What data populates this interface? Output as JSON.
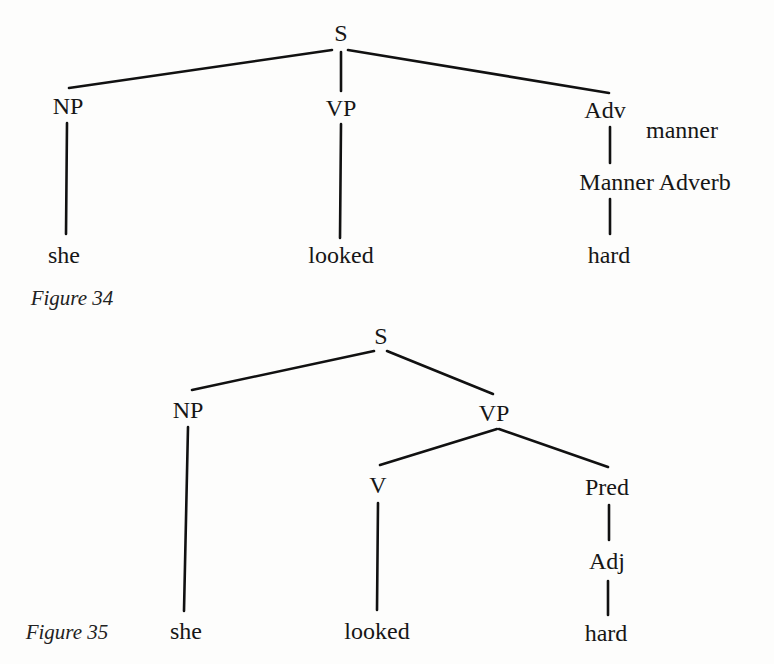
{
  "figures": [
    {
      "caption": "Figure 34",
      "nodes": {
        "s": "S",
        "np": "NP",
        "vp": "VP",
        "adv": "Adv",
        "adv_sub": "manner",
        "manner_adverb": "Manner Adverb",
        "she": "she",
        "looked": "looked",
        "hard": "hard"
      }
    },
    {
      "caption": "Figure 35",
      "nodes": {
        "s": "S",
        "np": "NP",
        "vp": "VP",
        "v": "V",
        "pred": "Pred",
        "adj": "Adj",
        "she": "she",
        "looked": "looked",
        "hard": "hard"
      }
    }
  ],
  "style": {
    "line_color": "#111111",
    "text_color": "#161616",
    "background": "#fdfdfc"
  }
}
